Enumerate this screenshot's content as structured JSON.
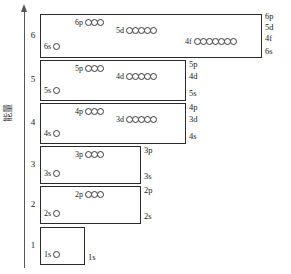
{
  "axis": {
    "label": "能量",
    "arrow": "up-arrow"
  },
  "shells": [
    {
      "number": "6",
      "orbitals": [
        {
          "label": "6s",
          "count": 1
        },
        {
          "label": "6p",
          "count": 3
        },
        {
          "label": "5d",
          "count": 5
        },
        {
          "label": "4f",
          "count": 7
        }
      ],
      "right_labels": [
        "6p",
        "5d",
        "4f",
        "6s"
      ]
    },
    {
      "number": "5",
      "orbitals": [
        {
          "label": "5s",
          "count": 1
        },
        {
          "label": "5p",
          "count": 3
        },
        {
          "label": "4d",
          "count": 5
        }
      ],
      "right_labels": [
        "5p",
        "4d",
        "5s"
      ]
    },
    {
      "number": "4",
      "orbitals": [
        {
          "label": "4s",
          "count": 1
        },
        {
          "label": "4p",
          "count": 3
        },
        {
          "label": "3d",
          "count": 5
        }
      ],
      "right_labels": [
        "4p",
        "3d",
        "4s"
      ]
    },
    {
      "number": "3",
      "orbitals": [
        {
          "label": "3s",
          "count": 1
        },
        {
          "label": "3p",
          "count": 3
        }
      ],
      "right_labels": [
        "3p",
        "3s"
      ]
    },
    {
      "number": "2",
      "orbitals": [
        {
          "label": "2s",
          "count": 1
        },
        {
          "label": "2p",
          "count": 3
        }
      ],
      "right_labels": [
        "2p",
        "2s"
      ]
    },
    {
      "number": "1",
      "orbitals": [
        {
          "label": "1s",
          "count": 1
        }
      ],
      "right_labels": [
        "1s"
      ]
    }
  ],
  "colors": {
    "line": "#2b2b2b",
    "axis": "#555555",
    "background": "#ffffff"
  }
}
